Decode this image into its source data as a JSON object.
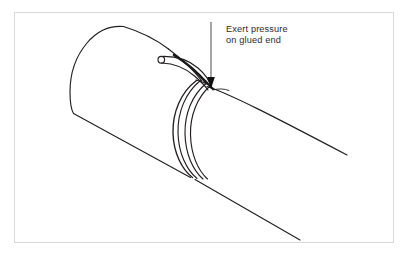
{
  "figure": {
    "kind": "technical-line-drawing",
    "background_color": "#ffffff",
    "ink_color": "#231f20",
    "frame": {
      "name": "image-border",
      "x": 14,
      "y": 12,
      "width": 380,
      "height": 231,
      "color": "#d8d8d8",
      "stroke_width": 1
    }
  },
  "annotation": {
    "line1": "Exert pressure",
    "line2": "on glued end",
    "text_color": "#2b2b2b",
    "leader": {
      "name": "leader-line",
      "x": 211,
      "y_top": 22,
      "y_bottom": 78,
      "color": "#4a4a4a",
      "stroke_width": 1
    },
    "arrowhead": {
      "name": "arrowhead",
      "tip_x": 211,
      "tip_y": 88,
      "width": 7,
      "height": 12,
      "color": "#111111"
    }
  },
  "parts": {
    "left_pipe": {
      "name": "left-pipe-section",
      "end_ellipse_cx": 92,
      "end_ellipse_cy": 70,
      "end_ellipse_rx": 22,
      "end_ellipse_ry": 46,
      "rotation_deg": -28
    },
    "collar": {
      "name": "pipe-collar",
      "arc_count": 4,
      "cx": 204,
      "cy": 128
    },
    "right_pipe": {
      "name": "right-pipe-section",
      "direction": "lower-right",
      "top_edge_end_x": 347,
      "top_edge_end_y": 155,
      "bottom_edge_end_x": 300,
      "bottom_edge_end_y": 240
    },
    "applicator": {
      "name": "glue-applicator-tube",
      "nozzle_circle_cx": 161,
      "nozzle_circle_cy": 60,
      "nozzle_circle_r": 3.4
    }
  }
}
